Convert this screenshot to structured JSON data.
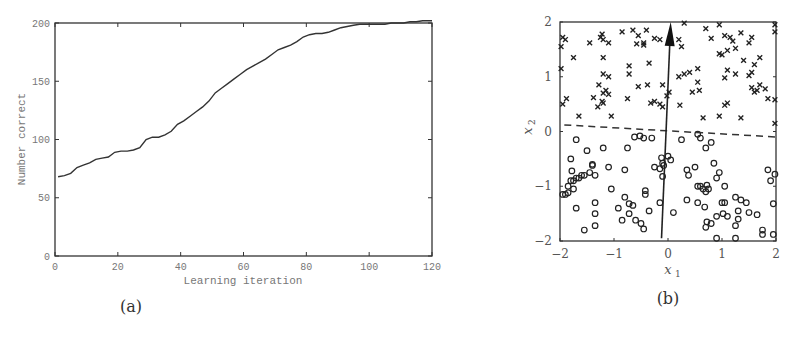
{
  "figure": {
    "panel_a_caption": "(a)",
    "panel_b_caption": "(b)"
  },
  "chart_data": [
    {
      "type": "line",
      "panel": "a",
      "title": "",
      "xlabel": "Learning iteration",
      "ylabel": "Number correct",
      "xlim": [
        0,
        120
      ],
      "ylim": [
        0,
        200
      ],
      "xticks": [
        0,
        20,
        40,
        60,
        80,
        100,
        120
      ],
      "yticks": [
        0,
        50,
        100,
        150,
        200
      ],
      "grid": false,
      "x": [
        1,
        3,
        5,
        7,
        9,
        11,
        13,
        15,
        17,
        19,
        21,
        23,
        25,
        27,
        29,
        31,
        33,
        35,
        37,
        39,
        41,
        43,
        45,
        47,
        49,
        51,
        53,
        55,
        57,
        59,
        61,
        63,
        65,
        67,
        69,
        71,
        73,
        75,
        77,
        79,
        81,
        83,
        85,
        87,
        89,
        91,
        93,
        95,
        97,
        99,
        101,
        103,
        105,
        107,
        109,
        111,
        113,
        115,
        117,
        120
      ],
      "values": [
        68,
        69,
        71,
        76,
        78,
        80,
        83,
        84,
        85,
        89,
        90,
        90,
        91,
        93,
        100,
        102,
        102,
        104,
        107,
        113,
        116,
        120,
        124,
        128,
        133,
        140,
        144,
        148,
        152,
        156,
        160,
        163,
        166,
        169,
        173,
        177,
        179,
        181,
        184,
        188,
        190,
        191,
        191,
        192,
        194,
        196,
        197,
        198,
        199,
        199,
        199,
        199,
        199,
        200,
        200,
        200,
        201,
        201,
        202,
        202
      ]
    },
    {
      "type": "scatter",
      "panel": "b",
      "title": "",
      "xlabel": "x1",
      "ylabel": "x2",
      "xlim": [
        -2,
        2
      ],
      "ylim": [
        -2,
        2
      ],
      "xticks": [
        -2,
        -1,
        0,
        1,
        2
      ],
      "yticks": [
        -2,
        -1,
        0,
        1,
        2
      ],
      "grid": false,
      "series": [
        {
          "name": "class +1 (crosses)",
          "marker": "x",
          "points": [
            [
              -1.98,
              1.55
            ],
            [
              -1.95,
              1.72
            ],
            [
              -1.9,
              1.68
            ],
            [
              -1.98,
              1.15
            ],
            [
              -1.75,
              1.35
            ],
            [
              -1.95,
              0.5
            ],
            [
              -1.88,
              0.6
            ],
            [
              -1.45,
              1.62
            ],
            [
              -1.25,
              1.72
            ],
            [
              -1.22,
              1.78
            ],
            [
              -1.2,
              1.68
            ],
            [
              -1.1,
              1.62
            ],
            [
              -0.85,
              1.82
            ],
            [
              -0.65,
              1.85
            ],
            [
              -0.55,
              1.75
            ],
            [
              -0.4,
              1.85
            ],
            [
              -0.25,
              1.7
            ],
            [
              -0.15,
              1.68
            ],
            [
              -1.2,
              1.35
            ],
            [
              -0.72,
              1.2
            ],
            [
              -0.72,
              1.05
            ],
            [
              -0.35,
              1.25
            ],
            [
              -1.2,
              1.05
            ],
            [
              -1.1,
              1.0
            ],
            [
              -1.28,
              0.85
            ],
            [
              -0.55,
              0.82
            ],
            [
              -0.38,
              0.85
            ],
            [
              -0.1,
              0.85
            ],
            [
              -1.15,
              0.75
            ],
            [
              -1.2,
              0.7
            ],
            [
              -1.1,
              0.68
            ],
            [
              -1.38,
              0.62
            ],
            [
              -1.3,
              0.45
            ],
            [
              -0.75,
              0.6
            ],
            [
              -0.32,
              0.52
            ],
            [
              -0.25,
              0.55
            ],
            [
              -0.15,
              0.5
            ],
            [
              -0.1,
              0.45
            ],
            [
              -0.02,
              0.65
            ],
            [
              0.02,
              0.72
            ],
            [
              -1.65,
              0.28
            ],
            [
              -1.05,
              0.28
            ],
            [
              -1.22,
              0.55
            ],
            [
              -1.2,
              0.52
            ],
            [
              -0.58,
              1.6
            ],
            [
              -0.45,
              1.62
            ],
            [
              -0.45,
              1.58
            ],
            [
              0.2,
              1.68
            ],
            [
              0.25,
              1.55
            ],
            [
              0.3,
              1.98
            ],
            [
              0.2,
              1.0
            ],
            [
              0.3,
              1.05
            ],
            [
              0.4,
              1.08
            ],
            [
              0.45,
              0.72
            ],
            [
              0.55,
              1.15
            ],
            [
              0.55,
              0.9
            ],
            [
              0.22,
              0.48
            ],
            [
              0.7,
              1.88
            ],
            [
              0.8,
              1.7
            ],
            [
              0.95,
              1.42
            ],
            [
              1.0,
              1.4
            ],
            [
              1.1,
              1.48
            ],
            [
              0.95,
              1.95
            ],
            [
              1.05,
              1.75
            ],
            [
              1.15,
              1.72
            ],
            [
              1.2,
              1.65
            ],
            [
              1.25,
              1.52
            ],
            [
              1.35,
              1.8
            ],
            [
              1.4,
              1.3
            ],
            [
              1.5,
              1.62
            ],
            [
              1.6,
              1.22
            ],
            [
              1.55,
              1.72
            ],
            [
              1.7,
              1.35
            ],
            [
              1.1,
              1.12
            ],
            [
              1.05,
              0.98
            ],
            [
              0.95,
              0.28
            ],
            [
              1.25,
              1.05
            ],
            [
              1.05,
              0.48
            ],
            [
              1.1,
              0.52
            ],
            [
              1.5,
              1.02
            ],
            [
              1.55,
              1.08
            ],
            [
              1.55,
              0.8
            ],
            [
              1.6,
              0.72
            ],
            [
              1.65,
              0.75
            ],
            [
              1.7,
              0.85
            ],
            [
              1.8,
              0.78
            ],
            [
              1.85,
              0.6
            ],
            [
              1.98,
              0.58
            ],
            [
              1.98,
              1.95
            ],
            [
              1.98,
              1.82
            ],
            [
              1.98,
              0.15
            ],
            [
              1.35,
              0.25
            ],
            [
              0.65,
              0.25
            ],
            [
              0.58,
              0.75
            ]
          ]
        },
        {
          "name": "class -1 (circles)",
          "marker": "o",
          "points": [
            [
              -1.8,
              -0.5
            ],
            [
              -1.7,
              -0.15
            ],
            [
              -1.5,
              -0.35
            ],
            [
              -1.4,
              -0.6
            ],
            [
              -1.55,
              -0.8
            ],
            [
              -1.6,
              -0.8
            ],
            [
              -1.65,
              -0.85
            ],
            [
              -1.7,
              -0.85
            ],
            [
              -1.75,
              -0.9
            ],
            [
              -1.8,
              -0.9
            ],
            [
              -1.85,
              -1.0
            ],
            [
              -1.78,
              -0.72
            ],
            [
              -1.45,
              -0.75
            ],
            [
              -1.4,
              -0.62
            ],
            [
              -1.35,
              -0.8
            ],
            [
              -1.2,
              -0.3
            ],
            [
              -1.1,
              -0.65
            ],
            [
              -1.75,
              -1.05
            ],
            [
              -1.9,
              -1.15
            ],
            [
              -1.95,
              -1.15
            ],
            [
              -1.85,
              -1.12
            ],
            [
              -1.7,
              -1.4
            ],
            [
              -1.55,
              -1.8
            ],
            [
              -1.35,
              -1.3
            ],
            [
              -1.35,
              -1.5
            ],
            [
              -1.35,
              -1.72
            ],
            [
              -1.05,
              -1.05
            ],
            [
              -0.92,
              -1.4
            ],
            [
              -0.85,
              -1.62
            ],
            [
              -0.8,
              -1.2
            ],
            [
              -0.72,
              -1.32
            ],
            [
              -0.65,
              -1.35
            ],
            [
              -0.72,
              -1.5
            ],
            [
              -0.6,
              -1.62
            ],
            [
              -0.5,
              -1.68
            ],
            [
              -0.45,
              -1.78
            ],
            [
              -0.42,
              -1.15
            ],
            [
              -0.42,
              -1.08
            ],
            [
              -0.35,
              -1.45
            ],
            [
              -0.15,
              -1.3
            ],
            [
              -0.8,
              -0.7
            ],
            [
              -0.75,
              -0.3
            ],
            [
              -0.62,
              -0.1
            ],
            [
              -0.52,
              -0.08
            ],
            [
              -0.45,
              -0.12
            ],
            [
              -0.3,
              -0.12
            ],
            [
              -0.25,
              -0.65
            ],
            [
              -0.12,
              -0.48
            ],
            [
              -0.1,
              -0.58
            ],
            [
              -0.08,
              -0.62
            ],
            [
              -0.15,
              -0.68
            ],
            [
              -0.1,
              -0.82
            ],
            [
              0.0,
              -0.45
            ],
            [
              0.05,
              -0.52
            ],
            [
              0.1,
              -1.48
            ],
            [
              0.25,
              -0.15
            ],
            [
              0.35,
              -0.7
            ],
            [
              0.38,
              -0.8
            ],
            [
              0.5,
              -0.65
            ],
            [
              0.55,
              -0.05
            ],
            [
              0.6,
              -0.12
            ],
            [
              0.7,
              -0.3
            ],
            [
              0.8,
              -0.2
            ],
            [
              0.55,
              -1.0
            ],
            [
              0.6,
              -1.0
            ],
            [
              0.65,
              -1.05
            ],
            [
              0.7,
              -1.1
            ],
            [
              0.72,
              -0.98
            ],
            [
              0.75,
              -1.05
            ],
            [
              0.85,
              -0.58
            ],
            [
              0.9,
              -0.85
            ],
            [
              0.35,
              -1.25
            ],
            [
              0.55,
              -1.3
            ],
            [
              0.68,
              -1.38
            ],
            [
              0.72,
              -1.65
            ],
            [
              0.7,
              -1.75
            ],
            [
              0.8,
              -1.68
            ],
            [
              0.9,
              -1.55
            ],
            [
              1.0,
              -1.3
            ],
            [
              1.05,
              -1.3
            ],
            [
              1.02,
              -1.5
            ],
            [
              1.1,
              -1.55
            ],
            [
              1.05,
              -1.0
            ],
            [
              1.25,
              -1.2
            ],
            [
              1.35,
              -1.25
            ],
            [
              1.45,
              -1.3
            ],
            [
              1.3,
              -1.45
            ],
            [
              1.5,
              -1.48
            ],
            [
              1.3,
              -1.6
            ],
            [
              1.25,
              -1.72
            ],
            [
              1.65,
              -1.52
            ],
            [
              1.75,
              -1.8
            ],
            [
              1.75,
              -1.88
            ],
            [
              1.85,
              -0.7
            ],
            [
              1.9,
              -0.9
            ],
            [
              1.98,
              -0.78
            ],
            [
              1.95,
              -1.32
            ],
            [
              1.95,
              -1.88
            ],
            [
              0.9,
              -1.95
            ],
            [
              1.25,
              -1.95
            ],
            [
              0.95,
              -0.75
            ]
          ]
        },
        {
          "name": "decision boundary",
          "type": "line",
          "style": "dashed",
          "points": [
            [
              -1.92,
              0.12
            ],
            [
              2.0,
              -0.1
            ]
          ]
        },
        {
          "name": "weight vector",
          "type": "arrow",
          "points": [
            [
              -0.12,
              -1.95
            ],
            [
              0.05,
              2.0
            ]
          ]
        }
      ]
    }
  ]
}
